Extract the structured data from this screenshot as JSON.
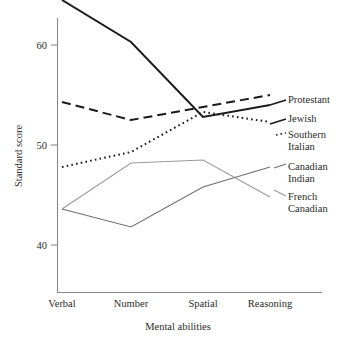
{
  "chart_data": {
    "type": "line",
    "title": "",
    "xlabel": "Mental abilities",
    "ylabel": "Standard score",
    "categories": [
      "Verbal",
      "Number",
      "Spatial",
      "Reasoning"
    ],
    "yticks": [
      40,
      50,
      60
    ],
    "ylim": [
      36.5,
      66.5
    ],
    "grid": false,
    "legend_position": "right-inline",
    "series": [
      {
        "name": "Jewish",
        "style": "solid",
        "color": "#1a1a1a",
        "width": 2.0,
        "values": [
          64.5,
          60.3,
          52.8,
          54.0
        ]
      },
      {
        "name": "Protestant",
        "style": "dashed",
        "color": "#1a1a1a",
        "width": 2.0,
        "values": [
          54.3,
          52.5,
          53.8,
          55.0
        ]
      },
      {
        "name": "Southern Italian",
        "style": "dotted",
        "color": "#1a1a1a",
        "width": 2.0,
        "values": [
          47.8,
          49.3,
          53.3,
          52.3
        ]
      },
      {
        "name": "French Canadian",
        "style": "solid",
        "color": "#9a9a9a",
        "width": 1.1,
        "values": [
          43.6,
          48.2,
          48.5,
          44.8
        ]
      },
      {
        "name": "Canadian Indian",
        "style": "solid",
        "color": "#6e6e6e",
        "width": 1.1,
        "values": [
          43.6,
          41.8,
          45.8,
          47.8
        ]
      }
    ],
    "legend_entries": [
      {
        "label_line1": "Protestant",
        "label_line2": ""
      },
      {
        "label_line1": "Jewish",
        "label_line2": ""
      },
      {
        "label_line1": "Southern",
        "label_line2": "Italian"
      },
      {
        "label_line1": "Canadian",
        "label_line2": "Indian"
      },
      {
        "label_line1": "French",
        "label_line2": "Canadian"
      }
    ]
  },
  "axes": {
    "y_title": "Standard score",
    "x_title": "Mental abilities",
    "tick_40": "40",
    "tick_50": "50",
    "tick_60": "60"
  },
  "categories": {
    "c0": "Verbal",
    "c1": "Number",
    "c2": "Spatial",
    "c3": "Reasoning"
  },
  "legend": {
    "protestant": "Protestant",
    "jewish": "Jewish",
    "southern": "Southern",
    "italian": "Italian",
    "canadian": "Canadian",
    "indian": "Indian",
    "french": "French",
    "french_canadian": "Canadian"
  },
  "colors": {
    "axis": "#8a8a8a",
    "ink": "#2b2b2b",
    "dark_line": "#1a1a1a",
    "grey_line_light": "#9a9a9a",
    "grey_line_mid": "#6e6e6e",
    "background": "#ffffff"
  }
}
